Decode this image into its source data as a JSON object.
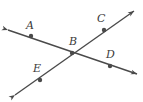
{
  "figure": {
    "width": 143,
    "height": 102,
    "background_color": "#ffffff",
    "stroke_color": "#4a4a4a",
    "label_color": "#3b3b3b",
    "stroke_width": 1.4,
    "dot_radius": 2.2
  },
  "labels": {
    "a": "A",
    "b": "B",
    "c": "C",
    "d": "D",
    "e": "E"
  },
  "chart_data": {
    "type": "diagram",
    "points": [
      {
        "name": "A",
        "x": 31,
        "y": 36,
        "label_x": 26,
        "label_y": 20,
        "on_line": "AD"
      },
      {
        "name": "B",
        "x": 72,
        "y": 53,
        "label_x": 69,
        "label_y": 36,
        "on_line": "both"
      },
      {
        "name": "C",
        "x": 104,
        "y": 30,
        "label_x": 97,
        "label_y": 13,
        "on_line": "EC"
      },
      {
        "name": "D",
        "x": 110,
        "y": 66,
        "label_x": 106,
        "label_y": 49,
        "on_line": "AD"
      },
      {
        "name": "E",
        "x": 40,
        "y": 80,
        "label_x": 33,
        "label_y": 63,
        "on_line": "EC"
      }
    ],
    "lines": [
      {
        "name": "AD",
        "through": [
          "A",
          "B",
          "D"
        ],
        "x1": 8,
        "y1": 30,
        "x2": 137,
        "y2": 74,
        "arrow_start": true,
        "arrow_end": true
      },
      {
        "name": "EC",
        "through": [
          "E",
          "B",
          "C"
        ],
        "x1": 15,
        "y1": 95,
        "x2": 134,
        "y2": 11,
        "arrow_start": true,
        "arrow_end": true
      }
    ],
    "intersection": {
      "name": "B",
      "x": 72,
      "y": 53
    }
  }
}
